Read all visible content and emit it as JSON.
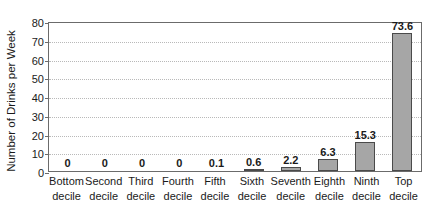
{
  "chart_data": {
    "type": "bar",
    "title": "",
    "xlabel": "",
    "ylabel": "Number of Drinks per Week",
    "ylim": [
      0,
      80
    ],
    "yticks": [
      0,
      10,
      20,
      30,
      40,
      50,
      60,
      70,
      80
    ],
    "grid": true,
    "legend": "none",
    "categories": [
      "Bottom decile",
      "Second decile",
      "Third decile",
      "Fourth decile",
      "Fifth decile",
      "Sixth decile",
      "Seventh decile",
      "Eighth decile",
      "Ninth decile",
      "Top decile"
    ],
    "category_lines": [
      [
        "Bottom",
        "decile"
      ],
      [
        "Second",
        "decile"
      ],
      [
        "Third",
        "decile"
      ],
      [
        "Fourth",
        "decile"
      ],
      [
        "Fifth",
        "decile"
      ],
      [
        "Sixth",
        "decile"
      ],
      [
        "Seventh",
        "decile"
      ],
      [
        "Eighth",
        "decile"
      ],
      [
        "Ninth",
        "decile"
      ],
      [
        "Top",
        "decile"
      ]
    ],
    "values": [
      0,
      0,
      0,
      0,
      0.1,
      0.6,
      2.2,
      6.3,
      15.3,
      73.6
    ],
    "value_labels": [
      "0",
      "0",
      "0",
      "0",
      "0.1",
      "0.6",
      "2.2",
      "6.3",
      "15.3",
      "73.6"
    ]
  },
  "colors": {
    "bar_fill": "#a6a6a6",
    "bar_border": "#4a4a4a",
    "axis": "#6b6b6b",
    "gridline": "#b9b9b9",
    "text": "#1a1a1a",
    "background": "#ffffff"
  }
}
